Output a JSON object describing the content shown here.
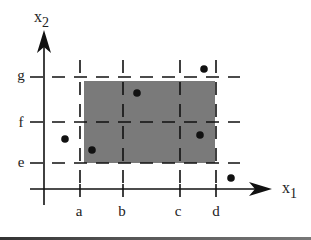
{
  "diagram": {
    "axes": {
      "x_label": "x",
      "x_sub": "1",
      "y_label": "x",
      "y_sub": "2"
    },
    "x_ticks": [
      {
        "label": "a",
        "px": 80
      },
      {
        "label": "b",
        "px": 123
      },
      {
        "label": "c",
        "px": 180
      },
      {
        "label": "d",
        "px": 216
      }
    ],
    "y_ticks": [
      {
        "label": "g",
        "py": 77
      },
      {
        "label": "f",
        "py": 122
      },
      {
        "label": "e",
        "py": 163
      }
    ],
    "region": {
      "x_from": "a",
      "x_to": "d",
      "y_from": "e",
      "y_to": "g",
      "fill": "#7a7a7a"
    },
    "points": [
      {
        "px": 137,
        "py": 93
      },
      {
        "px": 204,
        "py": 69
      },
      {
        "px": 65,
        "py": 139
      },
      {
        "px": 92,
        "py": 150
      },
      {
        "px": 200,
        "py": 135
      },
      {
        "px": 231,
        "py": 178
      }
    ],
    "colors": {
      "ink": "#111111",
      "region": "#7a7a7a"
    }
  }
}
